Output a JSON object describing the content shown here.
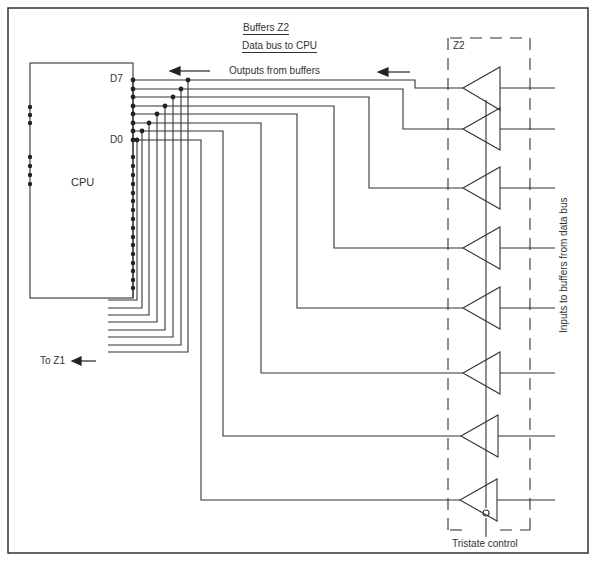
{
  "title": {
    "line1": "Buffers Z2",
    "line2": "Data  bus to CPU"
  },
  "labels": {
    "outputs": "Outputs  from buffers",
    "cpu": "CPU",
    "d7": "D7",
    "d0": "D0",
    "to_z1": "To Z1",
    "z2": "Z2",
    "inputs": "Inputs to buffers from data bus",
    "tristate": "Tristate  control"
  },
  "colors": {
    "line": "#333333",
    "background": "#ffffff"
  },
  "components": {
    "cpu": {
      "name": "CPU",
      "data_pins": [
        "D7",
        "D6",
        "D5",
        "D4",
        "D3",
        "D2",
        "D1",
        "D0"
      ]
    },
    "buffer_chip": {
      "name": "Z2",
      "buffer_count": 8,
      "type": "tristate buffer"
    }
  }
}
